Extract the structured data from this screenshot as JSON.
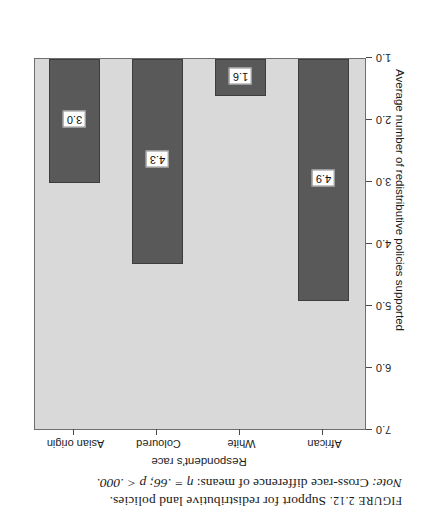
{
  "caption": {
    "figure_word": "FIGURE",
    "figure_number": "2.12.",
    "figure_title": "Support for redistributive land policies.",
    "note_word": "Note:",
    "note_text": "Cross-race difference of means:",
    "note_stat": "η = .66; p < .000."
  },
  "chart_data": {
    "type": "bar",
    "title": "",
    "categories": [
      "African",
      "White",
      "Coloured",
      "Asian origin"
    ],
    "values": [
      4.9,
      1.6,
      4.3,
      3.0
    ],
    "value_labels": [
      "4.9",
      "1.6",
      "4.3",
      "3.0"
    ],
    "xlabel": "Respondent's race",
    "ylabel": "Average number of redistributive policies supported",
    "ylim": [
      1.0,
      7.0
    ],
    "ytick_labels": [
      "1.0",
      "2.0",
      "3.0",
      "4.0",
      "5.0",
      "6.0",
      "7.0"
    ],
    "ytick_values": [
      1.0,
      2.0,
      3.0,
      4.0,
      5.0,
      6.0,
      7.0
    ],
    "grid": false,
    "legend": "none",
    "bar_color": "#595959",
    "plot_background": "#d9d9d9",
    "label_box_background": "#ffffff",
    "axis_color": "#6e6e6e",
    "rotation_degrees": 180
  }
}
